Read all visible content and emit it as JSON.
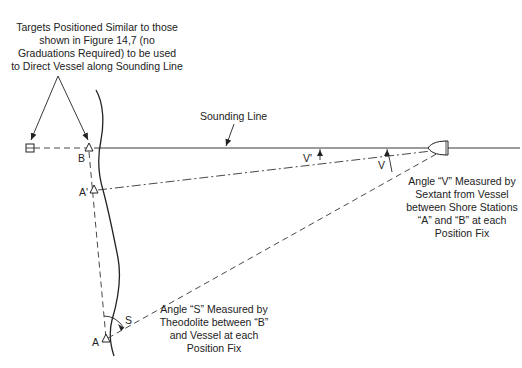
{
  "figure": {
    "targets_note": [
      "Targets Positioned Similar to those",
      "shown in Figure 14,7 (no",
      "Graduations Required) to be used",
      "to Direct Vessel along Sounding Line"
    ],
    "sounding_line_label": "Sounding Line",
    "stations": {
      "B": "B",
      "A_prime": "A'",
      "A": "A"
    },
    "angles": {
      "V_prime": "V'",
      "V": "V",
      "S": "S"
    },
    "angle_v_note": [
      "Angle “V” Measured by",
      "Sextant from Vessel",
      "between Shore Stations",
      "“A” and “B” at each",
      "Position Fix"
    ],
    "angle_s_note": [
      "Angle “S” Measured by",
      "Theodolite between “B”",
      "and Vessel at each",
      "Position Fix"
    ],
    "icons": {
      "rear_target": "square-target-icon",
      "front_target": "triangle-target-icon",
      "vessel": "boat-icon"
    }
  }
}
